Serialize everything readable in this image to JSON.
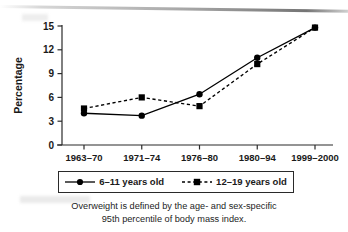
{
  "figure": {
    "ylabel": "Percentage",
    "caption_line1": "Overweight is defined by the age- and sex-specific",
    "caption_line2": "95th percentile of body mass index."
  },
  "legend": {
    "entries": [
      {
        "label": "6–11 years old",
        "marker": "circle",
        "line": "solid"
      },
      {
        "label": "12–19 years old",
        "marker": "square",
        "line": "dashed"
      }
    ]
  },
  "chart_data": {
    "type": "line",
    "title": "",
    "xlabel": "",
    "ylabel": "Percentage",
    "categories": [
      "1963–70",
      "1971–74",
      "1976–80",
      "1980–94",
      "1999–2000"
    ],
    "yticks": [
      0,
      3,
      6,
      9,
      12,
      15
    ],
    "ylim": [
      0,
      15
    ],
    "grid": false,
    "legend_position": "below-plot",
    "series": [
      {
        "name": "6–11 years old",
        "marker": "circle",
        "linestyle": "solid",
        "color": "#000000",
        "values": [
          4.0,
          3.7,
          6.4,
          11.0,
          14.8
        ]
      },
      {
        "name": "12–19 years old",
        "marker": "square",
        "linestyle": "dashed",
        "color": "#000000",
        "values": [
          4.6,
          6.0,
          4.9,
          10.2,
          14.8
        ]
      }
    ],
    "annotation": "Overweight is defined by the age- and sex-specific 95th percentile of body mass index."
  }
}
